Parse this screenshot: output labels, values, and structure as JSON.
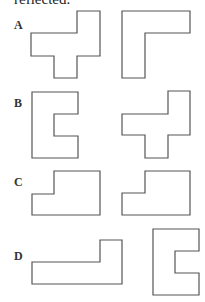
{
  "header": {
    "text": "reflected."
  },
  "options": [
    {
      "label": "A",
      "shapes": [
        "plus-like tetromino-cross shape",
        "L shape"
      ]
    },
    {
      "label": "B",
      "shapes": [
        "C/U shape opening right",
        "plus-like cross shape"
      ]
    },
    {
      "label": "C",
      "shapes": [
        "stepped L shape",
        "stepped L shape"
      ]
    },
    {
      "label": "D",
      "shapes": [
        "long L shape",
        "C/U shape opening right"
      ]
    }
  ],
  "colors": {
    "stroke": "#555555",
    "fill": "#ffffff",
    "text": "#333333"
  }
}
